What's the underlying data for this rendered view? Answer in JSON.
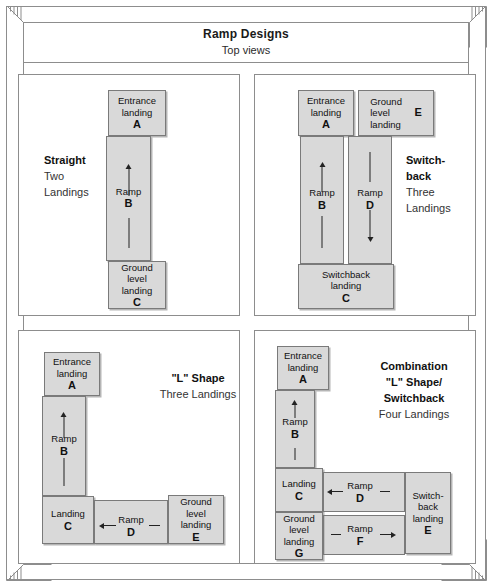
{
  "header": {
    "title": "Ramp Designs",
    "subtitle": "Top views"
  },
  "panels": [
    {
      "id": "straight",
      "caption": {
        "title": "Straight",
        "lines": [
          "Two",
          "Landings"
        ]
      },
      "boxes": [
        {
          "name": "entrance-landing",
          "label": "Entrance\nlanding",
          "letter": "A"
        },
        {
          "name": "ramp",
          "label": "Ramp",
          "letter": "B",
          "arrow": "up"
        },
        {
          "name": "ground-level-landing",
          "label": "Ground\nlevel\nlanding",
          "letter": "C"
        }
      ]
    },
    {
      "id": "switchback",
      "caption": {
        "title": "Switch-\nback",
        "lines": [
          "Three",
          "Landings"
        ]
      },
      "boxes": [
        {
          "name": "entrance-landing",
          "label": "Entrance\nlanding",
          "letter": "A"
        },
        {
          "name": "ground-level-landing",
          "label": "Ground\nlevel\nlanding",
          "letter": "E"
        },
        {
          "name": "ramp-up",
          "label": "Ramp",
          "letter": "B",
          "arrow": "up"
        },
        {
          "name": "ramp-down",
          "label": "Ramp",
          "letter": "D",
          "arrow": "down"
        },
        {
          "name": "switchback-landing",
          "label": "Switchback\nlanding",
          "letter": "C"
        }
      ]
    },
    {
      "id": "lshape",
      "caption": {
        "title": "\"L\" Shape",
        "lines": [
          "Three Landings"
        ]
      },
      "boxes": [
        {
          "name": "entrance-landing",
          "label": "Entrance\nlanding",
          "letter": "A"
        },
        {
          "name": "ramp-vertical",
          "label": "Ramp",
          "letter": "B",
          "arrow": "up"
        },
        {
          "name": "landing",
          "label": "Landing",
          "letter": "C"
        },
        {
          "name": "ramp-horizontal",
          "label": "Ramp",
          "letter": "D",
          "arrow": "left"
        },
        {
          "name": "ground-level-landing",
          "label": "Ground\nlevel\nlanding",
          "letter": "E"
        }
      ]
    },
    {
      "id": "combination",
      "caption": {
        "title": "Combination\n\"L\" Shape/\nSwitchback",
        "lines": [
          "Four Landings"
        ]
      },
      "boxes": [
        {
          "name": "entrance-landing",
          "label": "Entrance\nlanding",
          "letter": "A"
        },
        {
          "name": "ramp-vertical",
          "label": "Ramp",
          "letter": "B",
          "arrow": "up"
        },
        {
          "name": "landing",
          "label": "Landing",
          "letter": "C"
        },
        {
          "name": "ramp-upper",
          "label": "Ramp",
          "letter": "D",
          "arrow": "left"
        },
        {
          "name": "switchback-landing",
          "label": "Switch-\nback\nlanding",
          "letter": "E"
        },
        {
          "name": "ramp-lower",
          "label": "Ramp",
          "letter": "F",
          "arrow": "right"
        },
        {
          "name": "ground-level-landing",
          "label": "Ground\nlevel\nlanding",
          "letter": "G"
        }
      ]
    }
  ],
  "straight": {
    "caption_title": "Straight",
    "caption_line1": "Two",
    "caption_line2": "Landings",
    "a_label1": "Entrance",
    "a_label2": "landing",
    "a_letter": "A",
    "b_label": "Ramp",
    "b_letter": "B",
    "c_label1": "Ground",
    "c_label2": "level",
    "c_label3": "landing",
    "c_letter": "C"
  },
  "switchback": {
    "caption_title1": "Switch-",
    "caption_title2": "back",
    "caption_line1": "Three",
    "caption_line2": "Landings",
    "a_label1": "Entrance",
    "a_label2": "landing",
    "a_letter": "A",
    "e_label1": "Ground",
    "e_label2": "level",
    "e_label3": "landing",
    "e_letter": "E",
    "b_label": "Ramp",
    "b_letter": "B",
    "d_label": "Ramp",
    "d_letter": "D",
    "c_label1": "Switchback",
    "c_label2": "landing",
    "c_letter": "C"
  },
  "lshape": {
    "caption_title": "\"L\" Shape",
    "caption_line1": "Three Landings",
    "a_label1": "Entrance",
    "a_label2": "landing",
    "a_letter": "A",
    "b_label": "Ramp",
    "b_letter": "B",
    "c_label": "Landing",
    "c_letter": "C",
    "d_label": "Ramp",
    "d_letter": "D",
    "e_label1": "Ground",
    "e_label2": "level",
    "e_label3": "landing",
    "e_letter": "E"
  },
  "combination": {
    "caption_title1": "Combination",
    "caption_title2": "\"L\" Shape/",
    "caption_title3": "Switchback",
    "caption_line1": "Four Landings",
    "a_label1": "Entrance",
    "a_label2": "landing",
    "a_letter": "A",
    "b_label": "Ramp",
    "b_letter": "B",
    "c_label": "Landing",
    "c_letter": "C",
    "d_label": "Ramp",
    "d_letter": "D",
    "e_label1": "Switch-",
    "e_label2": "back",
    "e_label3": "landing",
    "e_letter": "E",
    "f_label": "Ramp",
    "f_letter": "F",
    "g_label1": "Ground",
    "g_label2": "level",
    "g_label3": "landing",
    "g_letter": "G"
  },
  "colors": {
    "box_fill": "#d9d9d9",
    "box_border": "#7a7a7a",
    "frame_line": "#8d8d8d",
    "text": "#111111",
    "background": "#ffffff"
  }
}
